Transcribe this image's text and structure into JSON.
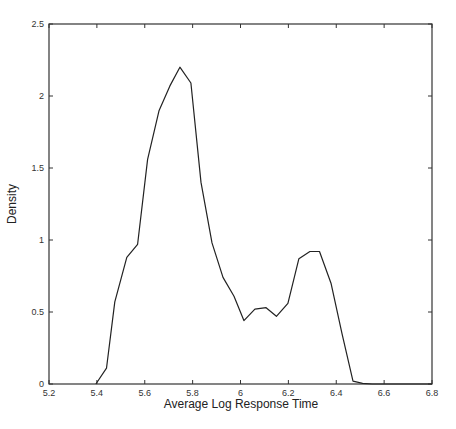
{
  "chart_data": {
    "type": "line",
    "title": "",
    "xlabel": "Average Log Response Time",
    "ylabel": "Density",
    "xlim": [
      5.2,
      6.8
    ],
    "ylim": [
      0,
      2.5
    ],
    "xticks": [
      5.2,
      5.4,
      5.6,
      5.8,
      6.0,
      6.2,
      6.4,
      6.6,
      6.8
    ],
    "xtick_labels": [
      "5.2",
      "5.4",
      "5.6",
      "5.8",
      "6",
      "6.2",
      "6.4",
      "6.6",
      "6.8"
    ],
    "yticks": [
      0,
      0.5,
      1,
      1.5,
      2,
      2.5
    ],
    "ytick_labels": [
      "0",
      "0.5",
      "1",
      "1.5",
      "2",
      "2.5"
    ],
    "grid": false,
    "legend": null,
    "series": [
      {
        "name": "density",
        "color": "#222222",
        "x": [
          5.396,
          5.44,
          5.475,
          5.525,
          5.57,
          5.612,
          5.66,
          5.705,
          5.747,
          5.793,
          5.835,
          5.881,
          5.927,
          5.973,
          6.014,
          6.06,
          6.107,
          6.15,
          6.198,
          6.244,
          6.29,
          6.33,
          6.378,
          6.424,
          6.47,
          6.51,
          6.55
        ],
        "y": [
          0.0,
          0.11,
          0.57,
          0.88,
          0.97,
          1.56,
          1.9,
          2.07,
          2.2,
          2.09,
          1.4,
          0.98,
          0.74,
          0.61,
          0.44,
          0.52,
          0.53,
          0.47,
          0.56,
          0.87,
          0.92,
          0.92,
          0.7,
          0.35,
          0.02,
          0.005,
          0.0
        ]
      }
    ]
  }
}
